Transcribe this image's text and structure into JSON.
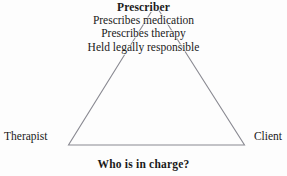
{
  "diagram": {
    "title_caption": "Who is in charge?",
    "background_color": "#fdfdfd",
    "line_color": "#8a8a92",
    "text_color": "#1a1a1a",
    "apex": {
      "heading": "Prescriber",
      "lines": [
        "Prescribes medication",
        "Prescribes therapy",
        "Held legally responsible"
      ]
    },
    "vertices": {
      "left_label": "Therapist",
      "right_label": "Client"
    }
  }
}
